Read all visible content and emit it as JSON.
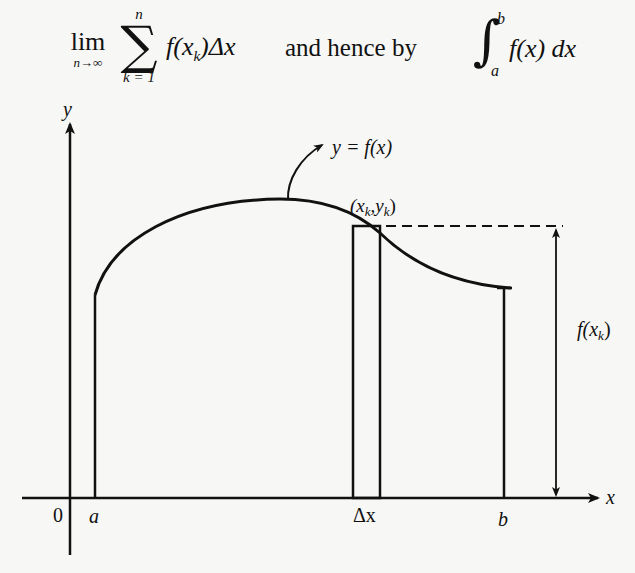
{
  "top_text": {
    "cut_line": "(partially visible line of text cut off at top)"
  },
  "formulas": {
    "lim": "lim",
    "lim_sub": "n→∞",
    "sigma_upper": "n",
    "sigma": "∑",
    "sigma_lower": "k = 1",
    "sum_f": "f(x",
    "sum_sub": "k",
    "sum_tail": ")Δx",
    "connector": "and hence by",
    "integral_sign": "∫",
    "integral_upper": "b",
    "integral_lower": "a",
    "integral_body": "f(x) dx"
  },
  "diagram": {
    "y_axis_label": "y",
    "x_axis_label": "x",
    "origin_label": "0",
    "a_label": "a",
    "b_label": "b",
    "delta_x_label": "Δx",
    "curve_label": "y = f(x)",
    "point_label_open": "(x",
    "point_label_sub1": "k",
    "point_label_mid": ",y",
    "point_label_sub2": "k",
    "point_label_close": ")",
    "height_label_f": "f(x",
    "height_label_sub": "k",
    "height_label_close": ")",
    "colors": {
      "ink": "#111111",
      "background": "#f7f7f5"
    }
  }
}
